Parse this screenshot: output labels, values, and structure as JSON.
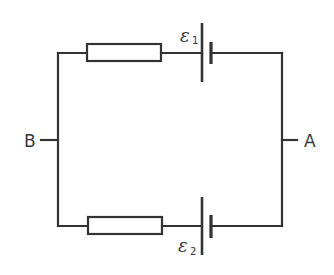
{
  "diagram": {
    "type": "circuit",
    "nodes": {
      "left": {
        "label": "B"
      },
      "right": {
        "label": "A"
      }
    },
    "branches": [
      {
        "position": "top",
        "components": [
          "resistor",
          "cell"
        ],
        "cell": {
          "symbol": "ε",
          "subscript": "1"
        }
      },
      {
        "position": "bottom",
        "components": [
          "resistor",
          "cell"
        ],
        "cell": {
          "symbol": "ε",
          "subscript": "2"
        }
      }
    ],
    "colors": {
      "line": "#333333",
      "background": "#ffffff"
    }
  }
}
